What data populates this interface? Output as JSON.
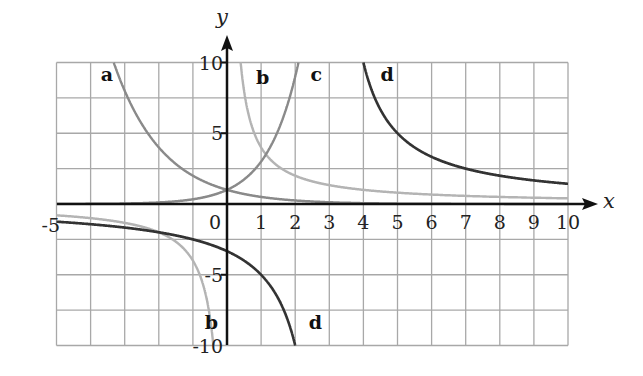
{
  "chart_data": {
    "type": "line",
    "title": "",
    "xlabel": "x",
    "ylabel": "y",
    "xlim": [
      -5,
      10
    ],
    "ylim": [
      -10,
      10
    ],
    "grid": true,
    "grid_x_step": 1,
    "grid_y_step": 2.5,
    "x_ticks": [
      {
        "value": -5,
        "label": "-5"
      },
      {
        "value": 0,
        "label": "0"
      },
      {
        "value": 1,
        "label": "1"
      },
      {
        "value": 2,
        "label": "2"
      },
      {
        "value": 3,
        "label": "3"
      },
      {
        "value": 4,
        "label": "4"
      },
      {
        "value": 5,
        "label": "5"
      },
      {
        "value": 6,
        "label": "6"
      },
      {
        "value": 7,
        "label": "7"
      },
      {
        "value": 8,
        "label": "8"
      },
      {
        "value": 9,
        "label": "9"
      },
      {
        "value": 10,
        "label": "10"
      }
    ],
    "y_ticks": [
      {
        "value": 10,
        "label": "10"
      },
      {
        "value": 5,
        "label": "5"
      },
      {
        "value": -5,
        "label": "-5"
      },
      {
        "value": -10,
        "label": "-10"
      }
    ],
    "series": [
      {
        "name": "a",
        "formula": "y = 0.5^x",
        "color": "#8a8a8a",
        "points": [
          [
            -3.32,
            10
          ],
          [
            -3,
            8
          ],
          [
            -2,
            4
          ],
          [
            -1,
            2
          ],
          [
            0,
            1
          ],
          [
            1,
            0.5
          ],
          [
            2,
            0.25
          ],
          [
            4,
            0.06
          ],
          [
            10,
            0.001
          ]
        ]
      },
      {
        "name": "b",
        "formula": "y = 4/x",
        "color": "#b4b4b4",
        "points": [
          [
            -5,
            -0.8
          ],
          [
            -2,
            -2
          ],
          [
            -1,
            -4
          ],
          [
            -0.4,
            -10
          ],
          [
            0.4,
            10
          ],
          [
            1,
            4
          ],
          [
            2,
            2
          ],
          [
            5,
            0.8
          ],
          [
            10,
            0.4
          ]
        ]
      },
      {
        "name": "c",
        "formula": "y = 3^x",
        "color": "#8a8a8a",
        "points": [
          [
            -5,
            0.004
          ],
          [
            -2,
            0.11
          ],
          [
            -1,
            0.33
          ],
          [
            0,
            1
          ],
          [
            1,
            3
          ],
          [
            2,
            9
          ],
          [
            2.1,
            10
          ]
        ]
      },
      {
        "name": "d",
        "formula": "y = 10/(x-3)",
        "color": "#333333",
        "points": [
          [
            -5,
            -1.25
          ],
          [
            -2,
            -2
          ],
          [
            0,
            -3.33
          ],
          [
            1,
            -5
          ],
          [
            2,
            -10
          ],
          [
            4,
            10
          ],
          [
            5,
            5
          ],
          [
            7,
            2.5
          ],
          [
            10,
            1.43
          ]
        ]
      }
    ],
    "labels": [
      {
        "text": "a",
        "x": -3.7,
        "y": 9.1
      },
      {
        "text": "b",
        "x": 0.85,
        "y": 8.9
      },
      {
        "text": "c",
        "x": 2.45,
        "y": 9.1
      },
      {
        "text": "d",
        "x": 4.5,
        "y": 9.1
      },
      {
        "text": "b",
        "x": -0.65,
        "y": -8.4
      },
      {
        "text": "d",
        "x": 2.4,
        "y": -8.4
      }
    ]
  },
  "colors": {
    "grid": "#a8a8a8",
    "axis": "#111111",
    "background": "#ffffff"
  }
}
